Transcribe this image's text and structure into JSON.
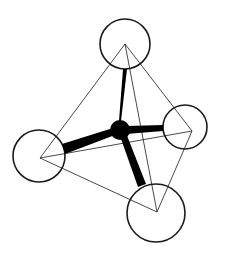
{
  "diagram": {
    "type": "tetrahedral-molecule",
    "colors": {
      "background": "#ffffff",
      "stroke": "#1a1a1a",
      "central_atom_fill": "#000000",
      "outer_atom_fill": "#ffffff"
    },
    "central_atom": {
      "id": "center",
      "cx": 120,
      "cy": 130,
      "r": 10
    },
    "outer_atoms": [
      {
        "id": "top",
        "cx": 125,
        "cy": 44,
        "r": 25,
        "vx": 125,
        "vy": 44
      },
      {
        "id": "right",
        "cx": 185,
        "cy": 127,
        "r": 22,
        "vx": 192,
        "vy": 131
      },
      {
        "id": "left",
        "cx": 39,
        "cy": 156,
        "r": 26,
        "vx": 40,
        "vy": 158
      },
      {
        "id": "bottom",
        "cx": 156,
        "cy": 213,
        "r": 29,
        "vx": 157,
        "vy": 212
      }
    ],
    "bonds": [
      {
        "to": "top",
        "points": "119,121 121,121 127,69 123,69"
      },
      {
        "to": "right",
        "points": "126,126 126,134 163,131 163,125"
      },
      {
        "to": "left",
        "points": "113,128 115,135 65,154 62,144"
      },
      {
        "to": "bottom",
        "points": "120,136 126,133 146,184 138,187"
      }
    ],
    "tetrahedron_edges": [
      {
        "from": "top",
        "to": "right"
      },
      {
        "from": "top",
        "to": "left"
      },
      {
        "from": "top",
        "to": "bottom"
      },
      {
        "from": "left",
        "to": "right"
      },
      {
        "from": "left",
        "to": "bottom"
      },
      {
        "from": "right",
        "to": "bottom"
      }
    ]
  }
}
